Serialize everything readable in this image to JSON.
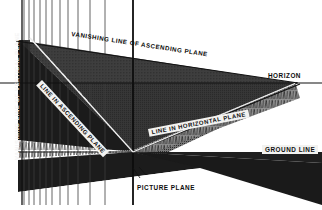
{
  "diagram": {
    "type": "technical-perspective-drawing",
    "labels": {
      "vanishing_line_ascending_plane": "VANISHING LINE OF ASCENDING PLANE",
      "vanishing_line_vertical_plane": "VANISHING LINE OF VERTICAL PLANE",
      "line_in_ascending_plane": "LINE IN ASCENDING PLANE",
      "line_in_horizontal_plane": "LINE IN HORIZONTAL PLANE",
      "horizon": "HORIZON",
      "ground_line": "GROUND LINE",
      "picture_plane": "PICTURE PLANE"
    },
    "colors": {
      "ink": "#111111",
      "paper": "#ffffff",
      "label_box": "#f2f2f0",
      "plane_dark": "#1a1a1a",
      "plane_mid": "#6f6f6f",
      "plane_light": "#b9b9b9"
    },
    "geometry": {
      "horizon_y": 83,
      "vanishing_point_x": 296,
      "picture_plane_x": 133,
      "ground_line_left_y": 152,
      "ground_line_right_y": 85,
      "vertical_line_xs": [
        24,
        29,
        34,
        40,
        46,
        52,
        60,
        68,
        78,
        90,
        105,
        133
      ],
      "canvas": [
        322,
        210
      ]
    }
  }
}
